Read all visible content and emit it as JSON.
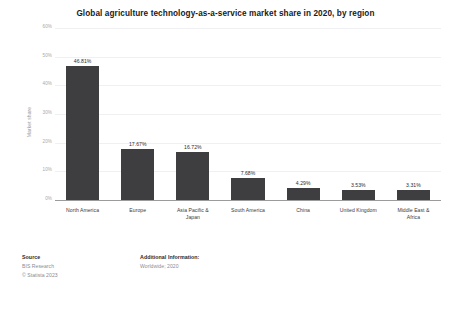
{
  "chart_data": {
    "type": "bar",
    "title": "Global agriculture technology-as-a-service market share in 2020, by region",
    "xlabel": "",
    "ylabel": "Market share",
    "ylim": [
      0,
      60
    ],
    "grid": true,
    "legend": "none",
    "categories": [
      "North America",
      "Europe",
      "Asia Pacific & Japan",
      "South America",
      "China",
      "United Kingdom",
      "Middle East & Africa"
    ],
    "category_lines": [
      [
        "North America"
      ],
      [
        "Europe"
      ],
      [
        "Asia Pacific &",
        "Japan"
      ],
      [
        "South America"
      ],
      [
        "China"
      ],
      [
        "United Kingdom"
      ],
      [
        "Middle East &",
        "Africa"
      ]
    ],
    "values": [
      46.81,
      17.67,
      16.72,
      7.68,
      4.29,
      3.53,
      3.31
    ],
    "value_labels": [
      "46.81%",
      "17.67%",
      "16.72%",
      "7.68%",
      "4.29%",
      "3.53%",
      "3.31%"
    ],
    "y_ticks": [
      0,
      10,
      20,
      30,
      40,
      50,
      60
    ],
    "y_tick_labels": [
      "0%",
      "10%",
      "20%",
      "30%",
      "40%",
      "50%",
      "60%"
    ],
    "bar_color": "#3e3e40",
    "gridline_color": "#f0f0f2",
    "axis_color": "#9b9b9b"
  },
  "footer": {
    "source_heading": "Source",
    "source_lines": [
      "BIS Research",
      "© Statista 2023"
    ],
    "additional_heading": "Additional Information:",
    "additional_lines": [
      "Worldwide; 2020"
    ]
  }
}
